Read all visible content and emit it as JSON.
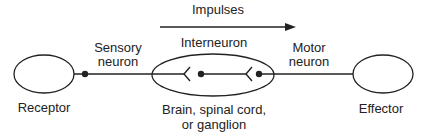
{
  "diagram": {
    "arrow_label": "Impulses",
    "nodes": {
      "receptor": {
        "label": "Receptor"
      },
      "effector": {
        "label": "Effector"
      },
      "cns": {
        "label_line1": "Brain, spinal cord,",
        "label_line2": "or ganglion"
      }
    },
    "neurons": {
      "sensory": {
        "line1": "Sensory",
        "line2": "neuron"
      },
      "interneuron": {
        "label": "Interneuron"
      },
      "motor": {
        "line1": "Motor",
        "line2": "neuron"
      }
    },
    "colors": {
      "stroke": "#222222",
      "background": "#ffffff"
    }
  }
}
